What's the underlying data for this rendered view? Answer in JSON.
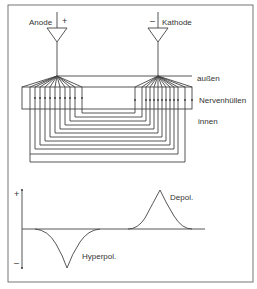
{
  "diagram": {
    "electrodes": {
      "anode": {
        "label": "Anode",
        "sign": "+"
      },
      "cathode": {
        "label": "Kathode",
        "sign": "–"
      }
    },
    "regions": {
      "outside": "außen",
      "membrane": "Nervenhüllen",
      "inside": "innen"
    },
    "graph": {
      "y_plus": "+",
      "y_minus": "–",
      "depol_label": "Depol.",
      "hyperpol_label": "Hyperpol."
    },
    "colors": {
      "line": "#444444",
      "background": "#ffffff"
    }
  }
}
